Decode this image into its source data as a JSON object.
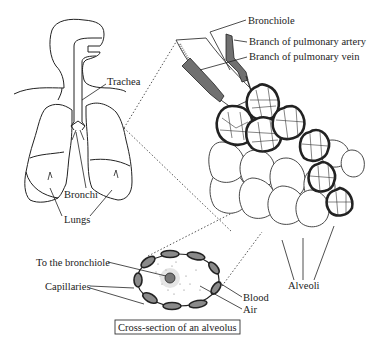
{
  "diagram": {
    "labels": {
      "trachea": "Trachea",
      "bronchi": "Bronchi",
      "lungs": "Lungs",
      "bronchiole": "Bronchiole",
      "pulmonary_artery": "Branch of pulmonary artery",
      "pulmonary_vein": "Branch of pulmonary vein",
      "alveoli": "Alveoli",
      "to_bronchiole": "To the bronchiole",
      "capillaries": "Capillaries",
      "blood": "Blood",
      "air": "Air",
      "cross_section_caption": "Cross-section of an alveolus"
    },
    "colors": {
      "ink": "#222222",
      "vessel_fill": "#707070",
      "capillary_fill": "#8a8a8a",
      "background": "#ffffff"
    }
  }
}
